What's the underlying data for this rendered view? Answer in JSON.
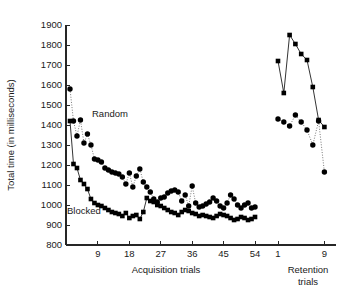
{
  "chart_data": {
    "type": "line",
    "title": "",
    "subtitle": "",
    "ylabel": "Total time (in milliseconds)",
    "xlabel_left": "Acquisition trials",
    "xlabel_right": "Retention trials",
    "xlabel_right_line2": "trials",
    "ylim": [
      800,
      1900
    ],
    "yticks": [
      800,
      900,
      1000,
      1100,
      1200,
      1300,
      1400,
      1500,
      1600,
      1700,
      1800,
      1900
    ],
    "ytick_labels": [
      "800",
      "900",
      "1000",
      "1100",
      "1200",
      "1300",
      "1400",
      "1500",
      "1600",
      "1700",
      "1800",
      "1900"
    ],
    "grid": false,
    "legend_position": "inline-annotation",
    "panels": [
      {
        "name": "acquisition",
        "xlim": [
          1,
          56
        ],
        "xticks": [
          9,
          18,
          27,
          36,
          45,
          54
        ],
        "xtick_labels": [
          "9",
          "18",
          "27",
          "36",
          "45",
          "54"
        ]
      },
      {
        "name": "retention",
        "xlim": [
          1,
          11
        ],
        "xticks": [
          1,
          9
        ],
        "xtick_labels": [
          "1",
          "9"
        ]
      }
    ],
    "series": [
      {
        "name": "Random",
        "marker": "circle",
        "line": "dotted",
        "annotation": "Random",
        "acquisition_x": [
          1,
          2,
          3,
          4,
          5,
          6,
          7,
          8,
          9,
          10,
          11,
          12,
          13,
          14,
          15,
          16,
          17,
          18,
          19,
          20,
          21,
          22,
          23,
          24,
          25,
          26,
          27,
          28,
          29,
          30,
          31,
          32,
          33,
          34,
          35,
          36,
          37,
          38,
          39,
          40,
          41,
          42,
          43,
          44,
          45,
          46,
          47,
          48,
          49,
          50,
          51,
          52,
          53,
          54
        ],
        "acquisition_y": [
          1580,
          1420,
          1345,
          1425,
          1310,
          1355,
          1300,
          1230,
          1225,
          1215,
          1185,
          1175,
          1165,
          1160,
          1155,
          1140,
          1105,
          1160,
          1090,
          1145,
          1180,
          1115,
          1090,
          1065,
          1030,
          1015,
          1035,
          1040,
          1060,
          1070,
          1075,
          1065,
          1020,
          1050,
          995,
          1095,
          1010,
          990,
          995,
          1005,
          1015,
          1035,
          1020,
          995,
          985,
          1010,
          1050,
          1030,
          1000,
          985,
          1000,
          1010,
          985,
          990
        ],
        "retention_x": [
          1,
          2,
          3,
          4,
          5,
          6,
          7,
          8,
          9
        ],
        "retention_y": [
          1430,
          1415,
          1395,
          1450,
          1415,
          1375,
          1300,
          1420,
          1165
        ]
      },
      {
        "name": "Blocked",
        "marker": "square",
        "line": "solid",
        "annotation": "Blocked",
        "acquisition_x": [
          1,
          2,
          3,
          4,
          5,
          6,
          7,
          8,
          9,
          10,
          11,
          12,
          13,
          14,
          15,
          16,
          17,
          18,
          19,
          20,
          21,
          22,
          23,
          24,
          25,
          26,
          27,
          28,
          29,
          30,
          31,
          32,
          33,
          34,
          35,
          36,
          37,
          38,
          39,
          40,
          41,
          42,
          43,
          44,
          45,
          46,
          47,
          48,
          49,
          50,
          51,
          52,
          53,
          54
        ],
        "acquisition_y": [
          1420,
          1205,
          1185,
          1125,
          1105,
          1080,
          1030,
          1010,
          1000,
          995,
          985,
          975,
          965,
          960,
          955,
          945,
          960,
          935,
          945,
          950,
          930,
          965,
          1035,
          1020,
          1015,
          1000,
          995,
          985,
          975,
          965,
          960,
          950,
          965,
          975,
          970,
          960,
          955,
          945,
          950,
          945,
          940,
          935,
          945,
          955,
          950,
          945,
          935,
          925,
          930,
          940,
          935,
          925,
          930,
          940
        ],
        "retention_x": [
          1,
          2,
          3,
          4,
          5,
          6,
          7,
          8,
          9
        ],
        "retention_y": [
          1720,
          1560,
          1850,
          1805,
          1755,
          1725,
          1590,
          1425,
          1390
        ]
      }
    ]
  },
  "colors": {
    "axis": "#262626",
    "marker": "#000000",
    "background": "#ffffff"
  }
}
